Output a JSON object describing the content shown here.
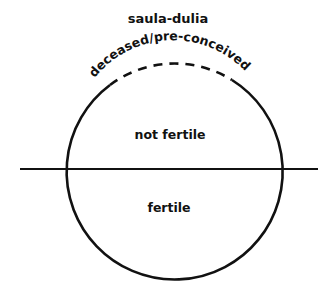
{
  "diagram": {
    "title": "saula-dulia",
    "arc_label": "deceased/pre-conceived",
    "upper_region_label": "not fertile",
    "lower_region_label": "fertile",
    "colors": {
      "stroke": "#111111",
      "background": "#ffffff"
    },
    "geometry": {
      "circle": {
        "cx": 172,
        "cy": 168,
        "r": 108
      },
      "divider_line": {
        "x1": 20,
        "x2": 318,
        "y": 169
      },
      "dashed_arc_span": {
        "from": [
          110,
          85
        ],
        "to": [
          232,
          80
        ]
      }
    }
  }
}
